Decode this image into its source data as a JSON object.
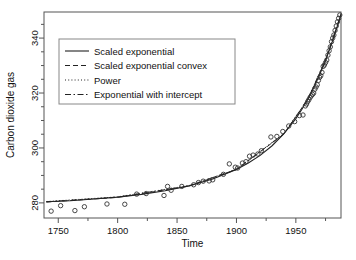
{
  "chart_data": {
    "type": "scatter",
    "title": "",
    "xlabel": "Time",
    "ylabel": "Carbon dioxide gas",
    "xlim": [
      1738,
      1988
    ],
    "ylim": [
      274.5,
      349.5
    ],
    "xticks": [
      1750,
      1800,
      1850,
      1900,
      1950
    ],
    "yticks": [
      280,
      300,
      320,
      340
    ],
    "xtick_labels": [
      "1750",
      "1800",
      "1850",
      "1900",
      "1950"
    ],
    "ytick_labels": [
      "280",
      "300",
      "320",
      "340"
    ],
    "minor_ticks": true,
    "grid": false,
    "legend_position": "top-left",
    "legend": [
      {
        "label": "Scaled exponential",
        "style": "solid"
      },
      {
        "label": "Scaled exponential convex",
        "style": "dashed"
      },
      {
        "label": "Power",
        "style": "dotted"
      },
      {
        "label": "Exponential with intercept",
        "style": "dashdot"
      }
    ],
    "marker": "open-circle",
    "points": [
      {
        "x": 1744,
        "y": 277.0
      },
      {
        "x": 1752,
        "y": 279.0
      },
      {
        "x": 1764,
        "y": 277.2
      },
      {
        "x": 1772,
        "y": 278.6
      },
      {
        "x": 1791,
        "y": 279.6
      },
      {
        "x": 1806,
        "y": 279.5
      },
      {
        "x": 1816,
        "y": 283.2
      },
      {
        "x": 1824,
        "y": 283.4
      },
      {
        "x": 1839,
        "y": 282.7
      },
      {
        "x": 1842,
        "y": 286.0
      },
      {
        "x": 1845,
        "y": 284.6
      },
      {
        "x": 1854,
        "y": 286.0
      },
      {
        "x": 1864,
        "y": 286.6
      },
      {
        "x": 1868,
        "y": 287.4
      },
      {
        "x": 1872,
        "y": 287.9
      },
      {
        "x": 1877,
        "y": 288.0
      },
      {
        "x": 1880,
        "y": 288.4
      },
      {
        "x": 1889,
        "y": 290.4
      },
      {
        "x": 1894,
        "y": 294.2
      },
      {
        "x": 1899,
        "y": 293.0
      },
      {
        "x": 1901,
        "y": 292.7
      },
      {
        "x": 1905,
        "y": 294.5
      },
      {
        "x": 1908,
        "y": 295.0
      },
      {
        "x": 1911,
        "y": 297.0
      },
      {
        "x": 1914,
        "y": 297.4
      },
      {
        "x": 1918,
        "y": 297.8
      },
      {
        "x": 1921,
        "y": 299.0
      },
      {
        "x": 1929,
        "y": 304.0
      },
      {
        "x": 1934,
        "y": 304.2
      },
      {
        "x": 1939,
        "y": 306.0
      },
      {
        "x": 1944,
        "y": 308.0
      },
      {
        "x": 1949,
        "y": 309.6
      },
      {
        "x": 1953,
        "y": 311.8
      },
      {
        "x": 1956,
        "y": 312.0
      },
      {
        "x": 1958,
        "y": 315.3
      },
      {
        "x": 1959,
        "y": 316.0
      },
      {
        "x": 1960,
        "y": 316.9
      },
      {
        "x": 1961,
        "y": 317.6
      },
      {
        "x": 1962,
        "y": 318.4
      },
      {
        "x": 1963,
        "y": 319.0
      },
      {
        "x": 1964,
        "y": 319.5
      },
      {
        "x": 1965,
        "y": 320.0
      },
      {
        "x": 1966,
        "y": 321.4
      },
      {
        "x": 1967,
        "y": 322.2
      },
      {
        "x": 1968,
        "y": 323.0
      },
      {
        "x": 1969,
        "y": 324.6
      },
      {
        "x": 1970,
        "y": 325.7
      },
      {
        "x": 1971,
        "y": 326.3
      },
      {
        "x": 1972,
        "y": 327.5
      },
      {
        "x": 1973,
        "y": 329.7
      },
      {
        "x": 1974,
        "y": 330.2
      },
      {
        "x": 1975,
        "y": 331.1
      },
      {
        "x": 1976,
        "y": 332.0
      },
      {
        "x": 1977,
        "y": 333.8
      },
      {
        "x": 1978,
        "y": 335.4
      },
      {
        "x": 1979,
        "y": 336.8
      },
      {
        "x": 1980,
        "y": 338.7
      },
      {
        "x": 1981,
        "y": 340.0
      },
      {
        "x": 1982,
        "y": 341.1
      },
      {
        "x": 1983,
        "y": 342.8
      },
      {
        "x": 1984,
        "y": 344.4
      },
      {
        "x": 1985,
        "y": 345.9
      },
      {
        "x": 1986,
        "y": 347.2
      },
      {
        "x": 1987,
        "y": 348.4
      }
    ],
    "fit_curves": [
      {
        "name": "Scaled exponential",
        "style": "solid",
        "points": [
          {
            "x": 1740,
            "y": 280.4
          },
          {
            "x": 1760,
            "y": 280.8
          },
          {
            "x": 1780,
            "y": 281.4
          },
          {
            "x": 1800,
            "y": 282.1
          },
          {
            "x": 1820,
            "y": 283.1
          },
          {
            "x": 1840,
            "y": 284.4
          },
          {
            "x": 1860,
            "y": 286.2
          },
          {
            "x": 1880,
            "y": 288.7
          },
          {
            "x": 1900,
            "y": 292.2
          },
          {
            "x": 1910,
            "y": 294.5
          },
          {
            "x": 1920,
            "y": 297.3
          },
          {
            "x": 1930,
            "y": 300.8
          },
          {
            "x": 1940,
            "y": 305.2
          },
          {
            "x": 1950,
            "y": 310.7
          },
          {
            "x": 1955,
            "y": 314.0
          },
          {
            "x": 1960,
            "y": 317.7
          },
          {
            "x": 1965,
            "y": 321.9
          },
          {
            "x": 1970,
            "y": 326.6
          },
          {
            "x": 1975,
            "y": 331.9
          },
          {
            "x": 1980,
            "y": 337.8
          },
          {
            "x": 1985,
            "y": 344.4
          },
          {
            "x": 1988,
            "y": 348.7
          }
        ]
      },
      {
        "name": "Scaled exponential convex",
        "style": "dashed",
        "points": [
          {
            "x": 1740,
            "y": 280.3
          },
          {
            "x": 1800,
            "y": 282.0
          },
          {
            "x": 1860,
            "y": 286.1
          },
          {
            "x": 1900,
            "y": 292.1
          },
          {
            "x": 1940,
            "y": 305.1
          },
          {
            "x": 1960,
            "y": 317.6
          },
          {
            "x": 1975,
            "y": 331.8
          },
          {
            "x": 1988,
            "y": 348.6
          }
        ]
      },
      {
        "name": "Power",
        "style": "dotted",
        "points": [
          {
            "x": 1740,
            "y": 280.5
          },
          {
            "x": 1800,
            "y": 282.2
          },
          {
            "x": 1860,
            "y": 286.3
          },
          {
            "x": 1900,
            "y": 292.3
          },
          {
            "x": 1940,
            "y": 305.3
          },
          {
            "x": 1960,
            "y": 317.8
          },
          {
            "x": 1975,
            "y": 332.0
          },
          {
            "x": 1988,
            "y": 348.8
          }
        ]
      },
      {
        "name": "Exponential with intercept",
        "style": "dashdot",
        "points": [
          {
            "x": 1740,
            "y": 280.4
          },
          {
            "x": 1800,
            "y": 282.1
          },
          {
            "x": 1860,
            "y": 286.2
          },
          {
            "x": 1900,
            "y": 292.2
          },
          {
            "x": 1940,
            "y": 305.2
          },
          {
            "x": 1960,
            "y": 317.7
          },
          {
            "x": 1975,
            "y": 331.9
          },
          {
            "x": 1988,
            "y": 348.7
          }
        ]
      }
    ]
  },
  "colors": {
    "axis": "#555555",
    "text": "#111111",
    "marker": "#333333",
    "curve": "#222222",
    "legend_border": "#888888",
    "background": "#ffffff"
  }
}
